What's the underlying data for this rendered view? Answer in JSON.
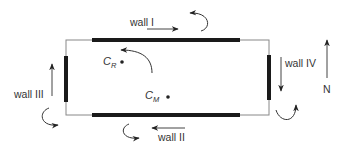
{
  "diagram": {
    "colors": {
      "outline": "#777777",
      "wall": "#1a1a1a",
      "arrow": "#333333",
      "text": "#333333"
    },
    "walls": [
      {
        "id": "I",
        "label": "wall I",
        "side": "top",
        "force_arrow": "east"
      },
      {
        "id": "II",
        "label": "wall II",
        "side": "bottom",
        "force_arrow": "west"
      },
      {
        "id": "III",
        "label": "wall III",
        "side": "left",
        "force_arrow": "north"
      },
      {
        "id": "IV",
        "label": "wall IV",
        "side": "right",
        "force_arrow": "south"
      }
    ],
    "points": {
      "center_rigidity": {
        "symbol": "C",
        "subscript": "R"
      },
      "center_mass": {
        "symbol": "C",
        "subscript": "M"
      }
    },
    "rotation": "counter-clockwise",
    "north": {
      "label": "N"
    }
  }
}
